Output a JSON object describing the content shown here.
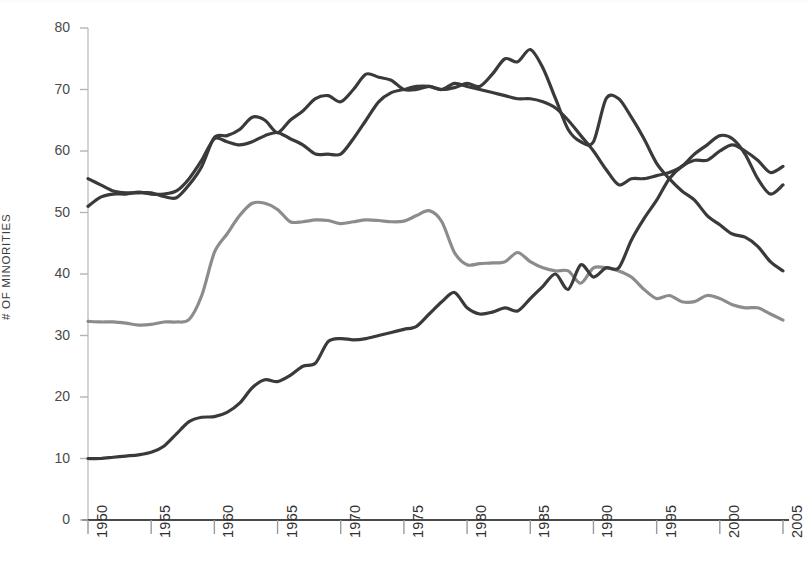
{
  "chart_data": {
    "type": "line",
    "title": "",
    "xlabel": "",
    "ylabel": "# OF MINORITIES",
    "xlim": [
      1950,
      2005
    ],
    "ylim": [
      0,
      80
    ],
    "grid": false,
    "legend": "none",
    "x_ticks": [
      "1950",
      "1955",
      "1960",
      "1965",
      "1970",
      "1975",
      "1980",
      "1985",
      "1990",
      "1995",
      "2000",
      "2005"
    ],
    "y_ticks": [
      "0",
      "10",
      "20",
      "30",
      "40",
      "50",
      "60",
      "70",
      "80"
    ],
    "x": [
      1950,
      1951,
      1952,
      1953,
      1954,
      1955,
      1956,
      1957,
      1958,
      1959,
      1960,
      1961,
      1962,
      1963,
      1964,
      1965,
      1966,
      1967,
      1968,
      1969,
      1970,
      1971,
      1972,
      1973,
      1974,
      1975,
      1976,
      1977,
      1978,
      1979,
      1980,
      1981,
      1982,
      1983,
      1984,
      1985,
      1986,
      1987,
      1988,
      1989,
      1990,
      1991,
      1992,
      1993,
      1994,
      1995,
      1996,
      1997,
      1998,
      1999,
      2000,
      2001,
      2002,
      2003,
      2004,
      2005
    ],
    "series": [
      {
        "name": "series-dark-upper",
        "color": "#3a3a3a",
        "width": 3.2,
        "values": [
          55.5,
          54.5,
          53.5,
          53.2,
          53.2,
          53.2,
          52.6,
          52.4,
          54.5,
          57.5,
          62.2,
          62.5,
          63.5,
          65.5,
          65.0,
          63.0,
          65.0,
          66.5,
          68.5,
          69.0,
          68.0,
          70.0,
          72.5,
          72.0,
          71.5,
          70.0,
          70.0,
          70.5,
          70.0,
          70.3,
          71.0,
          70.5,
          72.5,
          75.0,
          74.5,
          76.5,
          73.5,
          68.5,
          63.5,
          61.5,
          61.5,
          68.5,
          68.5,
          65.5,
          62.0,
          58.0,
          55.5,
          53.5,
          52.0,
          49.5,
          48.0,
          46.5,
          46.0,
          44.5,
          42.0,
          40.5
        ]
      },
      {
        "name": "series-dark-lower",
        "color": "#3a3a3a",
        "width": 3.2,
        "values": [
          51.0,
          52.5,
          53.0,
          53.0,
          53.3,
          53.0,
          53.0,
          53.5,
          55.5,
          58.5,
          62.0,
          61.5,
          61.0,
          61.5,
          62.5,
          63.0,
          62.0,
          61.0,
          59.5,
          59.5,
          59.5,
          62.0,
          65.0,
          68.0,
          69.5,
          70.0,
          70.5,
          70.5,
          70.0,
          71.0,
          70.5,
          70.0,
          69.5,
          69.0,
          68.5,
          68.5,
          68.0,
          67.0,
          65.0,
          62.5,
          60.0,
          57.0,
          54.5,
          55.5,
          55.5,
          56.0,
          56.5,
          57.5,
          59.5,
          61.0,
          62.5,
          62.0,
          59.5,
          55.5,
          53.0,
          54.5
        ]
      },
      {
        "name": "series-gray",
        "color": "#8c8c8c",
        "width": 3.2,
        "values": [
          32.3,
          32.2,
          32.2,
          32.0,
          31.7,
          31.8,
          32.2,
          32.2,
          32.6,
          36.5,
          43.5,
          46.5,
          49.5,
          51.5,
          51.5,
          50.5,
          48.5,
          48.5,
          48.8,
          48.7,
          48.2,
          48.5,
          48.8,
          48.7,
          48.5,
          48.6,
          49.5,
          50.3,
          48.5,
          43.5,
          41.5,
          41.7,
          41.8,
          42.0,
          43.5,
          42.0,
          41.0,
          40.5,
          40.5,
          38.5,
          41.0,
          41.0,
          40.5,
          39.5,
          37.5,
          36.0,
          36.5,
          35.5,
          35.5,
          36.5,
          36.0,
          35.0,
          34.5,
          34.5,
          33.5,
          32.5
        ]
      },
      {
        "name": "series-dark-rising",
        "color": "#3a3a3a",
        "width": 3.2,
        "values": [
          10.0,
          10.0,
          10.2,
          10.4,
          10.6,
          11.0,
          12.0,
          14.0,
          16.0,
          16.7,
          16.8,
          17.5,
          19.0,
          21.5,
          22.8,
          22.5,
          23.5,
          25.0,
          25.5,
          29.0,
          29.5,
          29.3,
          29.5,
          30.0,
          30.5,
          31.0,
          31.5,
          33.5,
          35.5,
          37.0,
          34.5,
          33.5,
          33.8,
          34.5,
          34.0,
          36.0,
          38.0,
          40.0,
          37.5,
          41.5,
          39.5,
          41.0,
          41.0,
          45.5,
          49.0,
          52.0,
          55.5,
          57.5,
          58.5,
          58.5,
          60.0,
          61.0,
          60.0,
          58.5,
          56.5,
          57.5
        ]
      }
    ]
  },
  "axis": {
    "y_title": "# OF MINORITIES"
  }
}
